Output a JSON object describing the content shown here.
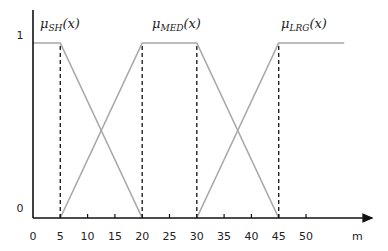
{
  "chart_data": {
    "type": "line",
    "title": "",
    "xlabel": "m",
    "ylabel": "",
    "xlim": [
      0,
      60
    ],
    "ylim": [
      0,
      1
    ],
    "x_ticks": [
      0,
      5,
      10,
      15,
      20,
      25,
      30,
      35,
      40,
      45,
      50
    ],
    "x_tick_labels": [
      "0",
      "5",
      "10",
      "15",
      "20",
      "25",
      "30",
      "35",
      "40",
      "45",
      "50"
    ],
    "y_ticks": [
      0,
      1
    ],
    "y_tick_labels": [
      "0",
      "1"
    ],
    "grid": false,
    "legend": "inline labels above each function",
    "series": [
      {
        "name": "μSH(x)",
        "label_main": "μ",
        "label_sub": "SH",
        "label_arg": "(x)",
        "x": [
          0,
          5,
          20
        ],
        "y": [
          1,
          1,
          0
        ]
      },
      {
        "name": "μMED(x)",
        "label_main": "μ",
        "label_sub": "MED",
        "label_arg": "(x)",
        "x": [
          5,
          20,
          30,
          45
        ],
        "y": [
          0,
          1,
          1,
          0
        ]
      },
      {
        "name": "μLRG(x)",
        "label_main": "μ",
        "label_sub": "LRG",
        "label_arg": "(x)",
        "x": [
          30,
          45,
          57
        ],
        "y": [
          0,
          1,
          1
        ]
      }
    ],
    "dashed_verticals": [
      5,
      20,
      30,
      45
    ],
    "colors": {
      "series_line": "#a8a8a8",
      "axis": "#111111",
      "dashed": "#222222"
    }
  }
}
